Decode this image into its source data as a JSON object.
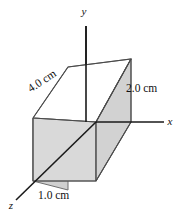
{
  "figure": {
    "background_color": "#ffffff",
    "axes": [
      {
        "name": "y",
        "label": "y",
        "direction": "up",
        "label_x": 84,
        "label_y": 15
      },
      {
        "name": "x",
        "label": "x",
        "direction": "right",
        "label_x": 170,
        "label_y": 124
      },
      {
        "name": "z",
        "label": "z",
        "direction": "down-left",
        "label_x": 11,
        "label_y": 207
      }
    ],
    "dimensions": [
      {
        "name": "depth",
        "label": "4.0 cm",
        "edge": "z",
        "x": 44,
        "y": 84,
        "rotation": -33
      },
      {
        "name": "height",
        "label": "2.0 cm",
        "edge": "y",
        "x": 126,
        "y": 88,
        "rotation": 0
      },
      {
        "name": "width",
        "label": "1.0 cm",
        "edge": "x",
        "x": 40,
        "y": 196,
        "rotation": 0
      }
    ],
    "colors": {
      "face_front": "#d9d9d9",
      "face_top": "#ffffff",
      "face_side": "#cfcfcf",
      "face_right": "#d2d2d2",
      "edge": "#6f6f6f",
      "edge_dark": "#4a4a4a",
      "axis": "#1a1a1a",
      "text": "#111111"
    },
    "geometry": {
      "origin": {
        "x": 96,
        "y": 122
      },
      "vertices": {
        "near_bottom_left": {
          "x": 33,
          "y": 181
        },
        "near_bottom_right": {
          "x": 96,
          "y": 181
        },
        "near_top_left": {
          "x": 33,
          "y": 118
        },
        "near_top_right": {
          "x": 96,
          "y": 122
        },
        "far_bottom_left": {
          "x": 68,
          "y": 128
        },
        "far_bottom_right": {
          "x": 131,
          "y": 122
        },
        "far_top_left": {
          "x": 68,
          "y": 67
        },
        "far_top_right": {
          "x": 131,
          "y": 59
        }
      }
    }
  }
}
